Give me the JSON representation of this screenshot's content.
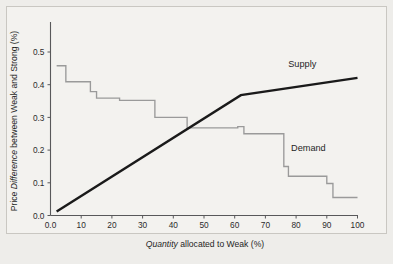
{
  "figure": {
    "background_color": "#eeedea",
    "panel_color": "#f3f2ef",
    "border_color": "#c9c7c2"
  },
  "chart_data": {
    "type": "line",
    "title": "",
    "subtitle": "",
    "xlabel_plain_prefix": "",
    "xlabel_italic": "Quantity",
    "xlabel_rest": " allocated to Weak (%)",
    "ylabel_plain_prefix": "Price ",
    "ylabel_italic": "Difference",
    "ylabel_rest": " between Weak and Strong (%)",
    "xlabel": "Quantity allocated to Weak (%)",
    "ylabel": "Price Difference between Weak and Strong (%)",
    "xlim": [
      0,
      100
    ],
    "ylim": [
      0.0,
      0.55
    ],
    "grid": false,
    "legend_position": "inline-annotations",
    "xticks": [
      0,
      10,
      20,
      30,
      40,
      50,
      60,
      70,
      80,
      90,
      100
    ],
    "xticklabels": [
      "0.0",
      "10",
      "20",
      "30",
      "40",
      "50",
      "60",
      "70",
      "80",
      "90",
      "100"
    ],
    "yticks": [
      0.0,
      0.1,
      0.2,
      0.3,
      0.4,
      0.5
    ],
    "yticklabels": [
      "0.0",
      "0.1",
      "0.2",
      "0.3",
      "0.4",
      "0.5"
    ],
    "series": [
      {
        "name": "Supply",
        "kind": "line",
        "color": "#1a1a1a",
        "linewidth": 2.4,
        "label_text": "Supply",
        "label_x": 82,
        "label_y": 0.455,
        "x": [
          2,
          62,
          100
        ],
        "y": [
          0.012,
          0.368,
          0.421
        ]
      },
      {
        "name": "Demand",
        "kind": "step",
        "color": "#9a9a9a",
        "linewidth": 1.35,
        "label_text": "Demand",
        "label_x": 84,
        "label_y": 0.196,
        "x": [
          2,
          5,
          5,
          13,
          13,
          15,
          15,
          22.5,
          22.5,
          34,
          34,
          44.5,
          44.5,
          61,
          61,
          63,
          63,
          76,
          76,
          77.5,
          77.5,
          90,
          90,
          92,
          92,
          100
        ],
        "y": [
          0.458,
          0.458,
          0.409,
          0.409,
          0.379,
          0.379,
          0.359,
          0.359,
          0.352,
          0.352,
          0.3,
          0.3,
          0.268,
          0.268,
          0.272,
          0.272,
          0.25,
          0.25,
          0.15,
          0.15,
          0.12,
          0.12,
          0.098,
          0.098,
          0.055,
          0.055
        ]
      }
    ],
    "annotations": [
      {
        "text": "Supply",
        "x": 82,
        "y": 0.455
      },
      {
        "text": "Demand",
        "x": 84,
        "y": 0.196
      }
    ]
  }
}
